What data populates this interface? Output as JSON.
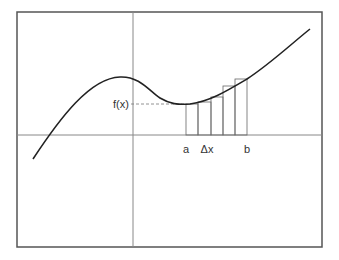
{
  "diagram": {
    "frame": {
      "x": 17,
      "y": 12,
      "width": 305,
      "height": 235,
      "stroke": "#555555"
    },
    "axes": {
      "color": "#888888",
      "y_axis_x": 133,
      "x_axis_y": 135
    },
    "curve": {
      "color": "#222222",
      "path": "M33,159 C60,118 90,78 120,77 C140,76 150,92 160,98 C170,104 178,105 190,104 C210,101 225,92 247,79 C270,64 290,45 310,29"
    },
    "function_label": {
      "text": "f(x)",
      "x": 113,
      "y": 108,
      "guide_y": 104,
      "guide_x_start": 131,
      "guide_x_end": 186
    },
    "rectangles": {
      "color": "#666666",
      "items": [
        {
          "x": 186,
          "width": 12,
          "top": 104
        },
        {
          "x": 198,
          "width": 13,
          "top": 102
        },
        {
          "x": 211,
          "width": 12,
          "top": 97
        },
        {
          "x": 223,
          "width": 12,
          "top": 86
        },
        {
          "x": 235,
          "width": 12,
          "top": 79
        }
      ]
    },
    "tick_labels": [
      {
        "text": "a",
        "x": 186,
        "y": 153
      },
      {
        "text": "Δx",
        "x": 207,
        "y": 153
      },
      {
        "text": "b",
        "x": 247,
        "y": 153
      }
    ]
  }
}
